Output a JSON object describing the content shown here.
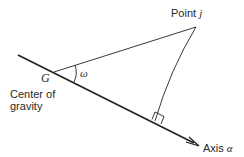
{
  "diagram": {
    "labels": {
      "point": "Point ",
      "point_var": "j",
      "vertex": "G",
      "angle": "ω",
      "cog_line1": "Center of",
      "cog_line2": "gravity",
      "axis": "Axis ",
      "axis_var": "α"
    },
    "colors": {
      "line": "#222222",
      "text": "#2a2a2a"
    }
  }
}
